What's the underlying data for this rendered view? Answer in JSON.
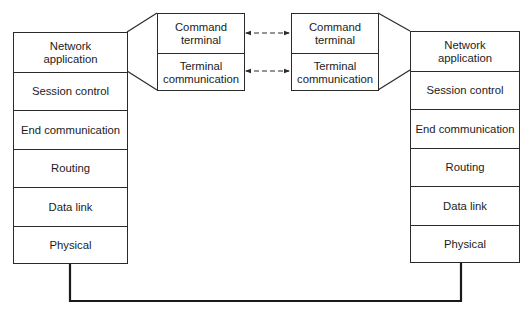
{
  "left_stack": {
    "layers": [
      {
        "label": "Network\napplication"
      },
      {
        "label": "Session control"
      },
      {
        "label": "End communication"
      },
      {
        "label": "Routing"
      },
      {
        "label": "Data link"
      },
      {
        "label": "Physical"
      }
    ]
  },
  "right_stack": {
    "layers": [
      {
        "label": "Network\napplication"
      },
      {
        "label": "Session control"
      },
      {
        "label": "End communication"
      },
      {
        "label": "Routing"
      },
      {
        "label": "Data link"
      },
      {
        "label": "Physical"
      }
    ]
  },
  "left_inset": {
    "layers": [
      {
        "label": "Command\nterminal"
      },
      {
        "label": "Terminal\ncommunication"
      }
    ]
  },
  "right_inset": {
    "layers": [
      {
        "label": "Command\nterminal"
      },
      {
        "label": "Terminal\ncommunication"
      }
    ]
  },
  "colors": {
    "line": "#2a2a2a",
    "background": "#ffffff"
  }
}
